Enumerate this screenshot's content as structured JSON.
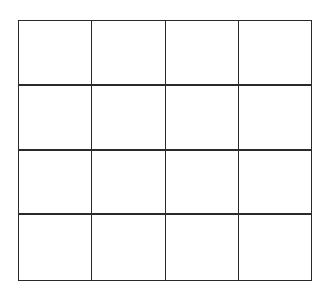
{
  "diagram": {
    "type": "grid",
    "rows": 4,
    "columns": 4,
    "cells": [
      [
        "",
        "",
        "",
        ""
      ],
      [
        "",
        "",
        "",
        ""
      ],
      [
        "",
        "",
        "",
        ""
      ],
      [
        "",
        "",
        "",
        ""
      ]
    ],
    "line_color": "#2a2a2a",
    "background_color": "#ffffff"
  }
}
